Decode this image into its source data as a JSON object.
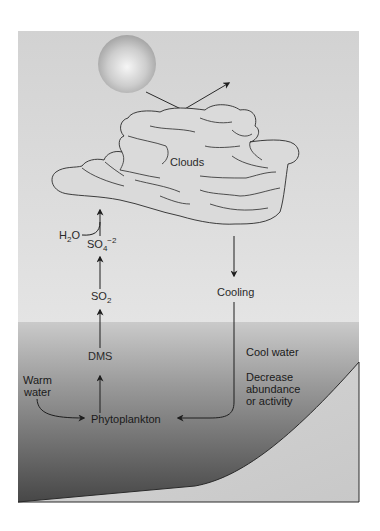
{
  "diagram": {
    "colors": {
      "air_top": "#d2d2d2",
      "air_bottom": "#e6e6e6",
      "water_top": "#c9c9c9",
      "water_bottom": "#474747",
      "seafloor": "#cfcfcf",
      "cloud_fill": "#d9d9d9",
      "sun_center": "#f4f4f4",
      "sun_edge": "#a8a8a8",
      "line": "#2a2a2a"
    },
    "elements": {
      "sun": {
        "label": ""
      },
      "clouds": {
        "label": "Clouds"
      },
      "h2o": {
        "main": "H",
        "sub": "2",
        "rest": "O"
      },
      "so4": {
        "main": "SO",
        "sub": "4",
        "sup": "−2"
      },
      "so2": {
        "main": "SO",
        "sub": "2"
      },
      "dms": {
        "label": "DMS"
      },
      "phytoplankton": {
        "label": "Phytoplankton"
      },
      "warm_water": {
        "line1": "Warm",
        "line2": "water"
      },
      "cooling": {
        "label": "Cooling"
      },
      "cool_water": {
        "label": "Cool water"
      },
      "effect": {
        "line1": "Decrease",
        "line2": "abundance",
        "line3": "or activity"
      }
    },
    "flows": [
      {
        "from": "Sun",
        "to": "Clouds",
        "note": "sunlight reflected by clouds"
      },
      {
        "from": "Phytoplankton",
        "to": "DMS"
      },
      {
        "from": "DMS",
        "to": "SO2"
      },
      {
        "from": "SO2",
        "to": "SO4-2"
      },
      {
        "from": "SO4-2 + H2O",
        "to": "Clouds"
      },
      {
        "from": "Clouds",
        "to": "Cooling"
      },
      {
        "from": "Cooling",
        "to": "Phytoplankton",
        "note": "Cool water: decrease abundance or activity"
      },
      {
        "from": "Warm water",
        "to": "Phytoplankton"
      }
    ]
  }
}
